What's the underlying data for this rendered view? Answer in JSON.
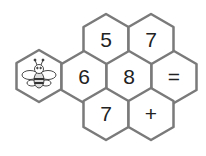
{
  "puzzle": {
    "cells": [
      {
        "id": "r1c1",
        "value": "5"
      },
      {
        "id": "r1c2",
        "value": "7"
      },
      {
        "id": "r2c1",
        "value": "6"
      },
      {
        "id": "r2c2",
        "value": "8"
      },
      {
        "id": "r2c3",
        "value": "="
      },
      {
        "id": "r3c1",
        "value": "7"
      },
      {
        "id": "r3c2",
        "value": "+"
      }
    ],
    "mascot_icon": "bee-icon",
    "colors": {
      "border": "#7a7a7a",
      "fill": "#ffffff",
      "text": "#222222"
    }
  }
}
